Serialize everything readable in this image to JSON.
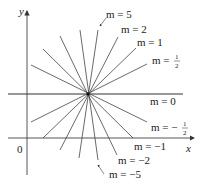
{
  "figure": {
    "axes": {
      "x_label": "x",
      "y_label": "y",
      "origin_label": "0"
    },
    "center": {
      "px": 88,
      "py": 94
    },
    "labels": {
      "m5": "m = 5",
      "m2": "m = 2",
      "m1": "m = 1",
      "mhalf_prefix": "m = ",
      "mhalf_num": "1",
      "mhalf_den": "2",
      "m0": "m = 0",
      "mneghalf_prefix": "m = −",
      "mneghalf_num": "1",
      "mneghalf_den": "2",
      "mneg1": "m = −1",
      "mneg2": "m = −2",
      "mneg5": "m = −5"
    },
    "slopes": [
      5,
      2,
      1,
      0.5,
      0,
      -0.5,
      -1,
      -2,
      -5
    ]
  }
}
